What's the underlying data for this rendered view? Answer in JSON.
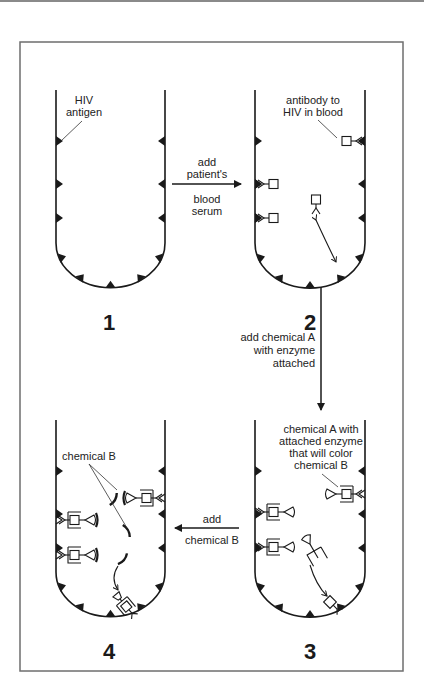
{
  "diagram": {
    "title": "",
    "tubes": [
      {
        "id": 1,
        "number_label": "1",
        "label_lines": [
          "HIV",
          "antigen"
        ]
      },
      {
        "id": 2,
        "number_label": "2",
        "label_lines": [
          "antibody to",
          "HIV in blood"
        ]
      },
      {
        "id": 3,
        "number_label": "3",
        "label_lines": [
          "chemical A with",
          "attached enzyme",
          "that will color",
          "chemical B"
        ]
      },
      {
        "id": 4,
        "number_label": "4",
        "label_lines": [
          "chemical B"
        ]
      }
    ],
    "steps": [
      {
        "from": 1,
        "to": 2,
        "direction": "right",
        "label_lines": [
          "add",
          "patient's",
          "blood",
          "serum"
        ]
      },
      {
        "from": 2,
        "to": 3,
        "direction": "down",
        "label_lines": [
          "add chemical A",
          "with enzyme",
          "attached"
        ]
      },
      {
        "from": 3,
        "to": 4,
        "direction": "left",
        "label_lines": [
          "add",
          "chemical B"
        ]
      }
    ],
    "colors": {
      "ink": "#1a1a1a",
      "frame": "#6e6e6e",
      "background": "#ffffff"
    }
  }
}
